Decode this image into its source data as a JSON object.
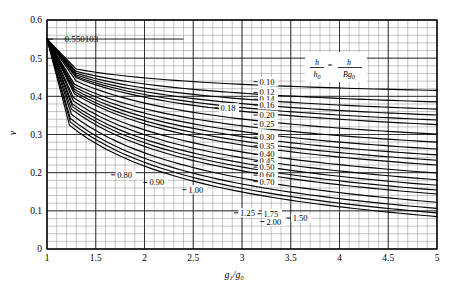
{
  "chart_data": {
    "type": "line",
    "title": "",
    "xlabel": "g1/g0",
    "ylabel": "v",
    "xlim": [
      1,
      5
    ],
    "ylim": [
      0,
      0.6
    ],
    "xticks": [
      "1",
      "1.5",
      "2",
      "2.5",
      "3",
      "3.5",
      "4",
      "4.5",
      "5"
    ],
    "xtick_values": [
      1,
      1.5,
      2,
      2.5,
      3,
      3.5,
      4,
      4.5,
      5
    ],
    "yticks": [
      "0",
      "0.1",
      "0.2",
      "0.3",
      "0.4",
      "0.5",
      "0.6"
    ],
    "ytick_values": [
      0,
      0.1,
      0.2,
      0.3,
      0.4,
      0.5,
      0.6
    ],
    "grid": true,
    "grid_minor_x": 0.1,
    "grid_minor_y": 0.02,
    "annotations": [
      {
        "text": "0.550103",
        "x": 1.18,
        "y": 0.5501,
        "note": "horizontal reference line value at left origin of curve fan"
      }
    ],
    "legend_position": "inside-upper-right",
    "legend_title_parts": {
      "numerator1": "h",
      "denominator1": "h",
      "denominator1_sub": "0",
      "equals": "=",
      "numerator2": "h",
      "denominator2_prefix": "Bg",
      "denominator2_sub": "0"
    },
    "series": [
      {
        "name": "0.10",
        "label": "0.10",
        "label_x": 3.18,
        "label_y": 0.4305,
        "y_at_x5": 0.4155,
        "y_start": 0.5501,
        "knee_x": 1.3,
        "knee_y": 0.4715
      },
      {
        "name": "0.12",
        "label": "0.12",
        "label_x": 3.18,
        "label_y": 0.4025,
        "y_at_x5": 0.3855,
        "y_start": 0.5501,
        "knee_x": 1.3,
        "knee_y": 0.4655
      },
      {
        "name": "0.14",
        "label": "0.14",
        "label_x": 3.18,
        "label_y": 0.3845,
        "y_at_x5": 0.3665,
        "y_start": 0.5501,
        "knee_x": 1.3,
        "knee_y": 0.4605
      },
      {
        "name": "0.16",
        "label": "0.16",
        "label_x": 3.18,
        "label_y": 0.3695,
        "y_at_x5": 0.351,
        "y_start": 0.5501,
        "knee_x": 1.3,
        "knee_y": 0.456
      },
      {
        "name": "0.18",
        "label": "0.18",
        "label_x": 2.78,
        "label_y": 0.362,
        "y_at_x5": 0.338,
        "y_start": 0.5501,
        "knee_x": 1.3,
        "knee_y": 0.452
      },
      {
        "name": "0.20",
        "label": "0.20",
        "label_x": 3.18,
        "label_y": 0.343,
        "y_at_x5": 0.326,
        "y_start": 0.5501,
        "knee_x": 1.3,
        "knee_y": 0.4485
      },
      {
        "name": "0.25",
        "label": "0.25",
        "label_x": 3.18,
        "label_y": 0.319,
        "y_at_x5": 0.301,
        "y_start": 0.5501,
        "knee_x": 1.3,
        "knee_y": 0.44
      },
      {
        "name": "0.30",
        "label": "0.30",
        "label_x": 3.18,
        "label_y": 0.2855,
        "y_at_x5": 0.28,
        "y_start": 0.5501,
        "knee_x": 1.28,
        "knee_y": 0.432
      },
      {
        "name": "0.35",
        "label": "0.35",
        "label_x": 3.18,
        "label_y": 0.2625,
        "y_at_x5": 0.262,
        "y_start": 0.5501,
        "knee_x": 1.28,
        "knee_y": 0.425
      },
      {
        "name": "0.40",
        "label": "0.40",
        "label_x": 3.18,
        "label_y": 0.2405,
        "y_at_x5": 0.2465,
        "y_start": 0.5501,
        "knee_x": 1.28,
        "knee_y": 0.4185
      },
      {
        "name": "0.45",
        "label": "0.45",
        "label_x": 3.18,
        "label_y": 0.2215,
        "y_at_x5": 0.2325,
        "y_start": 0.5501,
        "knee_x": 1.28,
        "knee_y": 0.4125
      },
      {
        "name": "0.50",
        "label": "0.50",
        "label_x": 3.18,
        "label_y": 0.2065,
        "y_at_x5": 0.22,
        "y_start": 0.5501,
        "knee_x": 1.28,
        "knee_y": 0.407
      },
      {
        "name": "0.60",
        "label": "0.60",
        "label_x": 3.18,
        "label_y": 0.1855,
        "y_at_x5": 0.199,
        "y_start": 0.5501,
        "knee_x": 1.27,
        "knee_y": 0.397
      },
      {
        "name": "0.70",
        "label": "0.70",
        "label_x": 3.18,
        "label_y": 0.1685,
        "y_at_x5": 0.1815,
        "y_start": 0.5501,
        "knee_x": 1.27,
        "knee_y": 0.388
      },
      {
        "name": "0.80",
        "label": "0.80",
        "label_x": 1.72,
        "label_y": 0.1865,
        "y_at_x5": 0.167,
        "y_start": 0.5501,
        "knee_x": 1.26,
        "knee_y": 0.38
      },
      {
        "name": "0.90",
        "label": "0.90",
        "label_x": 2.05,
        "label_y": 0.1665,
        "y_at_x5": 0.1545,
        "y_start": 0.5501,
        "knee_x": 1.26,
        "knee_y": 0.373
      },
      {
        "name": "1.00",
        "label": "1.00",
        "label_x": 2.45,
        "label_y": 0.1475,
        "y_at_x5": 0.144,
        "y_start": 0.5501,
        "knee_x": 1.25,
        "knee_y": 0.3665
      },
      {
        "name": "1.25",
        "label": "1.25",
        "label_x": 2.98,
        "label_y": 0.087,
        "y_at_x5": 0.1225,
        "y_start": 0.5501,
        "knee_x": 1.25,
        "knee_y": 0.353
      },
      {
        "name": "1.50",
        "label": "1.50",
        "label_x": 3.52,
        "label_y": 0.0735,
        "y_at_x5": 0.1065,
        "y_start": 0.5501,
        "knee_x": 1.24,
        "knee_y": 0.342
      },
      {
        "name": "1.75",
        "label": "1.75",
        "label_x": 3.22,
        "label_y": 0.0845,
        "y_at_x5": 0.0945,
        "y_start": 0.5501,
        "knee_x": 1.24,
        "knee_y": 0.3325
      },
      {
        "name": "2.00",
        "label": "2.00",
        "label_x": 3.25,
        "label_y": 0.064,
        "y_at_x5": 0.085,
        "y_start": 0.5501,
        "knee_x": 1.23,
        "knee_y": 0.3245
      }
    ]
  },
  "axes": {
    "x_title_html": "g1/g0",
    "y_title_html": "v"
  }
}
